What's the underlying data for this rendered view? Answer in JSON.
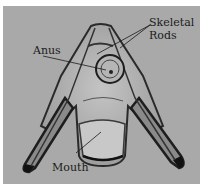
{
  "figure": {
    "background_color": "#a9a9a9",
    "labels": {
      "skeletal_rods_line1": "Skeletal",
      "skeletal_rods_line2": "Rods",
      "anus": "Anus",
      "mouth": "Mouth"
    }
  }
}
